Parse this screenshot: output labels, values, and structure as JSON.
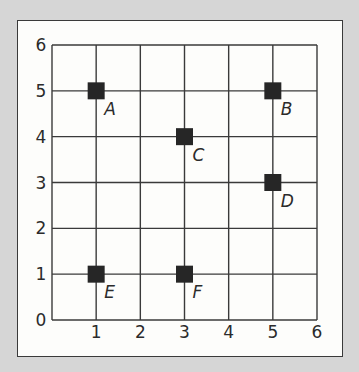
{
  "chart_data": {
    "type": "scatter",
    "title": "",
    "xlabel": "",
    "ylabel": "",
    "xlim": [
      0,
      6
    ],
    "ylim": [
      0,
      6
    ],
    "grid": true,
    "x_ticks": [
      "1",
      "2",
      "3",
      "4",
      "5",
      "6"
    ],
    "y_ticks": [
      "0",
      "1",
      "2",
      "3",
      "4",
      "5",
      "6"
    ],
    "marker": "square",
    "points": [
      {
        "label": "A",
        "x": 1,
        "y": 5
      },
      {
        "label": "B",
        "x": 5,
        "y": 5
      },
      {
        "label": "C",
        "x": 3,
        "y": 4
      },
      {
        "label": "D",
        "x": 5,
        "y": 3
      },
      {
        "label": "E",
        "x": 1,
        "y": 1
      },
      {
        "label": "F",
        "x": 3,
        "y": 1
      }
    ]
  },
  "colors": {
    "background": "#d6d6d6",
    "panel": "#fdfdfb",
    "grid": "#3a3a3a",
    "marker": "#262626",
    "text": "#2b2b2b"
  }
}
